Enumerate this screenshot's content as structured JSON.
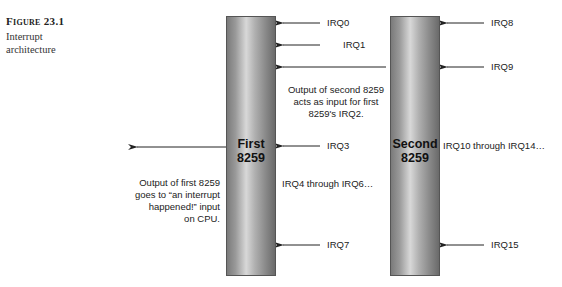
{
  "caption": {
    "figure_number": "Figure 23.1",
    "title": "Interrupt architecture"
  },
  "chips": [
    {
      "id": "first",
      "label_line1": "First",
      "label_line2": "8259"
    },
    {
      "id": "second",
      "label_line1": "Second",
      "label_line2": "8259"
    }
  ],
  "first_chip_inputs": {
    "irq0": "IRQ0",
    "irq1": "IRQ1",
    "irq3": "IRQ3",
    "irq4_6": "IRQ4 through IRQ6…",
    "irq7": "IRQ7"
  },
  "second_chip_inputs": {
    "irq8": "IRQ8",
    "irq9": "IRQ9",
    "irq10_14": "IRQ10 through IRQ14…",
    "irq15": "IRQ15"
  },
  "notes": {
    "cascade": [
      "Output of second 8259",
      "acts as input for first",
      "8259's IRQ2."
    ],
    "cpu_output": [
      "Output of first 8259",
      "goes to “an interrupt",
      "happened!” input",
      "on CPU."
    ]
  },
  "colors": {
    "arrow": "#222222",
    "bar_dark": "#6a6a6a",
    "bar_light": "#d8d8d8"
  }
}
